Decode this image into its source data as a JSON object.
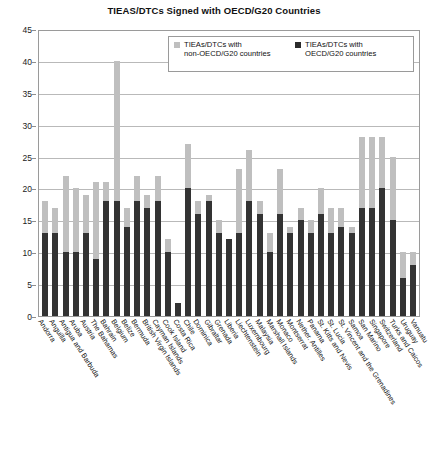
{
  "chart_data": {
    "type": "bar",
    "stacked": true,
    "title": "TIEAS/DTCs Signed with OECD/G20 Countries",
    "xlabel": "",
    "ylabel": "",
    "ylim": [
      0,
      45
    ],
    "ytick_step": 5,
    "yticks": [
      0,
      5,
      10,
      15,
      20,
      25,
      30,
      35,
      40,
      45
    ],
    "grid": true,
    "legend_position": "top-right-inside",
    "colors": {
      "non_oecd": "#bfbfbf",
      "oecd": "#333333",
      "gridline": "#b9b9b9",
      "axis": "#9a9a9a"
    },
    "categories": [
      "Andorra",
      "Anguilla",
      "Antigua and Barbuda",
      "Aruba",
      "Austria",
      "The Bahamas",
      "Bahrain",
      "Belgium",
      "Belize",
      "Bermuda",
      "British Virgin Islands",
      "Cayman Islands",
      "Cook Island",
      "Costa Rica",
      "Chile",
      "Dominica",
      "Gibraltar",
      "Grenada",
      "Liberia",
      "Liechtenstein",
      "Luxembourg",
      "Malaysia",
      "Marshall Islands",
      "Monaco",
      "Montserrat",
      "Nether. Antilles",
      "Panama",
      "St. Kitts and Nevis",
      "St. Lucia",
      "St. Vincent and the Grenadines",
      "Samoa",
      "San Marino",
      "Singapore",
      "Switzerland",
      "Turks and Caicos",
      "Uruguay",
      "Vanuatu"
    ],
    "series": [
      {
        "name": "TIEAs/DTCs with OECD/G20 countries",
        "color": "#333333",
        "values": [
          13,
          13,
          10,
          10,
          13,
          9,
          18,
          18,
          14,
          18,
          17,
          18,
          10,
          2,
          20,
          16,
          18,
          13,
          12,
          13,
          18,
          16,
          10,
          16,
          13,
          15,
          13,
          16,
          13,
          14,
          13,
          17,
          17,
          20,
          15,
          6,
          8
        ]
      },
      {
        "name": "TIEAs/DTCs with non-OECD/G20 countries",
        "color": "#bfbfbf",
        "values": [
          5,
          4,
          12,
          10,
          6,
          12,
          3,
          22,
          3,
          4,
          2,
          4,
          2,
          0,
          7,
          2,
          1,
          2,
          0,
          10,
          8,
          2,
          3,
          7,
          1,
          2,
          2,
          4,
          4,
          3,
          1,
          11,
          11,
          8,
          10,
          4,
          2
        ]
      }
    ],
    "totals": [
      18,
      17,
      22,
      20,
      19,
      21,
      21,
      40,
      17,
      22,
      19,
      22,
      12,
      2,
      27,
      18,
      19,
      15,
      12,
      23,
      26,
      18,
      13,
      23,
      14,
      17,
      15,
      20,
      17,
      17,
      14,
      28,
      28,
      28,
      25,
      10,
      10
    ]
  },
  "legend": {
    "items": [
      {
        "swatch": "light",
        "line1": "TIEAs/DTCs with",
        "line2": "non-OECD/G20 countries"
      },
      {
        "swatch": "dark",
        "line1": "TIEAs/DTCs with",
        "line2": "OECD/G20 countries"
      }
    ]
  }
}
